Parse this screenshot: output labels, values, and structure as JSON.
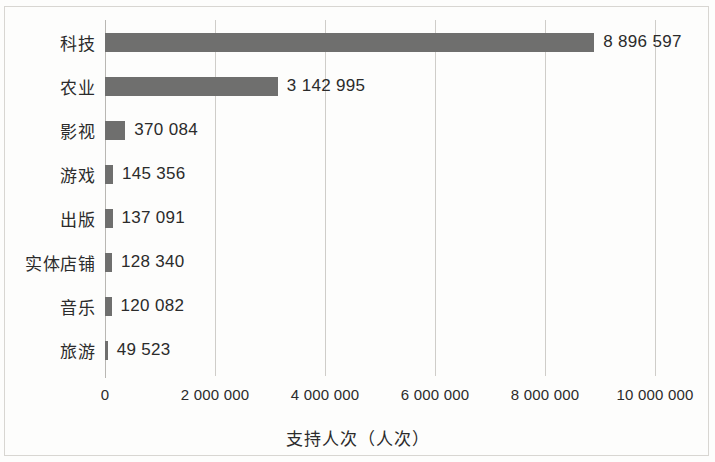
{
  "chart_data": {
    "type": "bar",
    "orientation": "horizontal",
    "title": "",
    "xlabel": "支持人次（人次）",
    "ylabel": "",
    "categories": [
      "科技",
      "农业",
      "影视",
      "游戏",
      "出版",
      "实体店铺",
      "音乐",
      "旅游"
    ],
    "values": [
      8896597,
      3142995,
      370084,
      145356,
      137091,
      128340,
      120082,
      49523
    ],
    "value_labels": [
      "8 896 597",
      "3 142 995",
      "370 084",
      "145 356",
      "137 091",
      "128 340",
      "120 082",
      "49 523"
    ],
    "xlim": [
      0,
      10000000
    ],
    "xticks": [
      0,
      2000000,
      4000000,
      6000000,
      8000000,
      10000000
    ],
    "xtick_labels": [
      "0",
      "2 000 000",
      "4 000 000",
      "6 000 000",
      "8 000 000",
      "10 000 000"
    ],
    "grid": true,
    "grid_axis": "x",
    "legend": false,
    "bar_color": "#6f6f6e",
    "grid_color": "#cfcdc9",
    "text_color": "#2b2b2b",
    "background_color": "#fdfdfc"
  }
}
